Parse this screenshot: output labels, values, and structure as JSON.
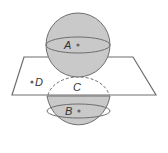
{
  "diagram": {
    "type": "geometry",
    "colors": {
      "sphere_fill": "#c9c9c9",
      "stroke": "#6e6e6e",
      "plane_fill": "#ffffff",
      "point": "#666666"
    },
    "points": [
      {
        "id": "A",
        "label": "A",
        "role": "center of upper sphere"
      },
      {
        "id": "B",
        "label": "B",
        "role": "center of lower sphere"
      },
      {
        "id": "C",
        "label": "C",
        "role": "tangent point on plane"
      },
      {
        "id": "D",
        "label": "D",
        "role": "point on plane"
      }
    ],
    "labels": {
      "a": "A",
      "b": "B",
      "c": "C",
      "d": "D"
    }
  }
}
